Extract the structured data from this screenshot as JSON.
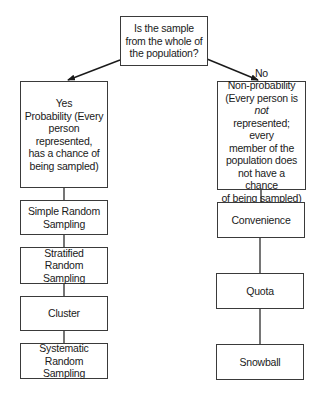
{
  "diagram": {
    "root": {
      "label": "Is the sample from the whole of the population?",
      "lines": [
        "Is the sample",
        "from the whole of",
        "the population?"
      ]
    },
    "branches": [
      {
        "id": "yes",
        "lines": [
          "Yes",
          "Probability (Every",
          "person represented,",
          "has a chance of",
          "being sampled)"
        ],
        "children": [
          "Simple Random Sampling",
          "Stratified Random Sampling",
          "Cluster",
          "Systematic Random Sampling"
        ],
        "children_lines": [
          [
            "Simple Random",
            "Sampling"
          ],
          [
            "Stratified Random",
            "Sampling"
          ],
          [
            "Cluster"
          ],
          [
            "Systematic",
            "Random Sampling"
          ]
        ]
      },
      {
        "id": "no",
        "lines_html_note": "word 'not' is italic",
        "lines": [
          "No",
          "Non-probability",
          "(Every person is ",
          "not",
          "represented; every",
          "member of the",
          "population does",
          "not have a chance",
          "of being sampled)"
        ],
        "children": [
          "Convenience",
          "Quota",
          "Snowball"
        ]
      }
    ],
    "colors": {
      "line": "#1a1a1a",
      "box_border": "#3a3a3a",
      "background": "#ffffff"
    }
  }
}
